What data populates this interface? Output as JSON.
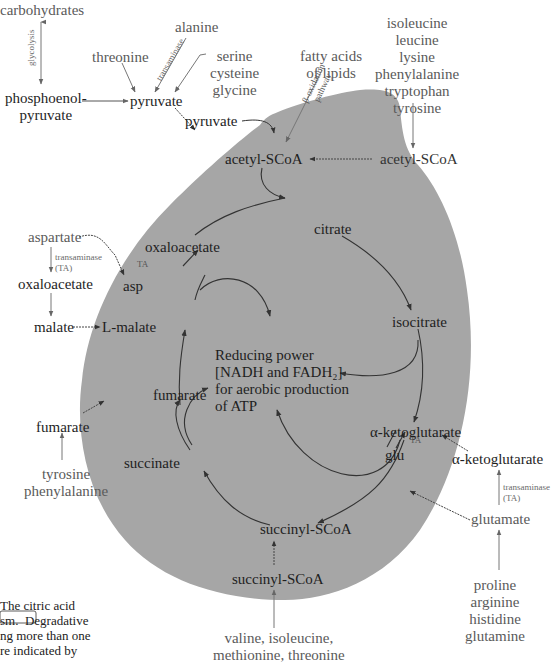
{
  "diagram": {
    "colors": {
      "cell_fill": "#a6a6a6",
      "outer_text": "#5a5a5a",
      "inner_text": "#1e1e1e",
      "arrow": "#333333",
      "background": "#ffffff"
    },
    "outer_labels": {
      "carbohydrates": "carbohydrates",
      "glycolysis": "glycolysis",
      "phosphoenolpyruvate": "phosphoenol-\npyruvate",
      "threonine": "threonine",
      "alanine": "alanine",
      "transaminase_top": "transaminase",
      "serine_group": "serine\ncysteine\nglycine",
      "pyruvate_outer": "pyruvate",
      "fatty_acids": "fatty acids\nof lipids",
      "beta_oxidation": "β-oxidation\npathway",
      "ketogenic_aa": "isoleucine\nleucine\nlysine\nphenylalanine\ntryptophan\ntyrosine",
      "acetyl_scoa_outer": "acetyl-SCoA",
      "aspartate": "aspartate",
      "transaminase_left": "transaminase\n(TA)",
      "oxaloacetate_outer": "oxaloacetate",
      "malate_outer": "malate",
      "fumarate_outer": "fumarate",
      "tyr_phe": "tyrosine\nphenylalanine",
      "alpha_kg_outer": "α-ketoglutarate",
      "transaminase_right": "transaminase\n(TA)",
      "glutamate": "glutamate",
      "glutamate_family": "proline\narginine\nhistidine\nglutamine",
      "succinyl_scoa_outer": "succinyl-SCoA",
      "succinyl_family": "valine, isoleucine,\nmethionine, threonine"
    },
    "inner_labels": {
      "pyruvate_inner": "pyruvate",
      "acetyl_scoa_inner": "acetyl-SCoA",
      "citrate": "citrate",
      "isocitrate": "isocitrate",
      "alpha_kg_inner": "α-ketoglutarate",
      "glu": "glu",
      "ta_right": "TA",
      "succinyl_scoa_inner": "succinyl-SCoA",
      "succinate": "succinate",
      "fumarate_inner": "fumarate",
      "l_malate": "L-malate",
      "asp": "asp",
      "ta_left": "TA",
      "oxaloacetate_inner": "oxaloacetate",
      "reducing_power": "Reducing power\n[NADH and FADH₂]\nfor aerobic production\nof ATP"
    },
    "caption_fragment": "The citric acid\nsm.  Degradative\nng more than one\nre indicated by"
  }
}
